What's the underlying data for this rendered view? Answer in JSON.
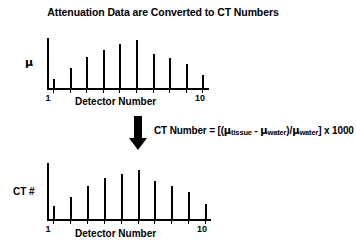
{
  "title": "Attenuation Data are Converted to CT Numbers",
  "formula": {
    "prefix": "CT Number = [(",
    "mu": "μ",
    "sub_tissue": "tissue",
    "minus": " - ",
    "sub_water": "water",
    "mid": ")/",
    "sub_water2": "water",
    "suffix": "] x 1000",
    "full_text": "CT Number = [(μ tissue - μ water)/μ water] x 1000"
  },
  "arrow": {
    "icon": "down-block-arrow-icon",
    "direction": "down",
    "color": "#000000"
  },
  "colors": {
    "bar": "#000000",
    "axis": "#000000",
    "background": "#ffffff",
    "text": "#000000"
  },
  "chart_data": [
    {
      "type": "bar",
      "name": "attenuation-chart",
      "title": "",
      "xlabel": "Detector Number",
      "ylabel": "μ",
      "categories": [
        "1",
        "2",
        "3",
        "4",
        "5",
        "6",
        "7",
        "8",
        "9",
        "10"
      ],
      "tick_labels": {
        "first": "1",
        "last": "10"
      },
      "values": [
        9,
        20,
        31,
        38,
        44,
        48,
        34,
        30,
        24,
        13
      ],
      "ylim": [
        0,
        50
      ],
      "grid": false,
      "legend": "none"
    },
    {
      "type": "bar",
      "name": "ct-number-chart",
      "title": "",
      "xlabel": "Detector Number",
      "ylabel": "CT #",
      "categories": [
        "1",
        "2",
        "3",
        "4",
        "5",
        "6",
        "7",
        "8",
        "9",
        "10"
      ],
      "tick_labels": {
        "first": "1",
        "last": "10"
      },
      "values": [
        13,
        22,
        33,
        41,
        45,
        49,
        38,
        33,
        27,
        15
      ],
      "ylim": [
        0,
        56
      ],
      "grid": false,
      "legend": "none"
    }
  ]
}
